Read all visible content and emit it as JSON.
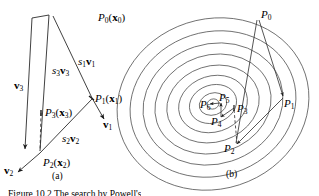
{
  "figure": {
    "panels": [
      {
        "id": "a",
        "label": "(a)",
        "description": "Vector construction diagram for conjugate direction search",
        "points": [
          {
            "name": "P0",
            "label_main": "P",
            "label_sub": "0",
            "label_arg": "(x",
            "label_arg_sub": "0",
            "label_arg_close": ")",
            "full": "P0(x0)",
            "x": 98,
            "y": 18
          },
          {
            "name": "P1",
            "label_main": "P",
            "label_sub": "1",
            "label_arg": "(x",
            "label_arg_sub": "1",
            "label_arg_close": ")",
            "full": "P1(x1)",
            "x": 94,
            "y": 99
          },
          {
            "name": "P2",
            "label_main": "P",
            "label_sub": "2",
            "label_arg": "(x",
            "label_arg_sub": "2",
            "label_arg_close": ")",
            "full": "P2(x2)",
            "x": 42,
            "y": 161
          },
          {
            "name": "P3",
            "label_main": "P",
            "label_sub": "3",
            "label_arg": "(x",
            "label_arg_sub": "3",
            "label_arg_close": ")",
            "full": "P3(x3)",
            "x": 45,
            "y": 113
          }
        ],
        "vectors": [
          {
            "name": "v1",
            "base": "v",
            "sub": "1",
            "full": "v1",
            "x": 102,
            "y": 123
          },
          {
            "name": "v2",
            "base": "v",
            "sub": "2",
            "full": "v2",
            "x": 4,
            "y": 168
          },
          {
            "name": "v3",
            "base": "v",
            "sub": "3",
            "full": "v3",
            "x": 15,
            "y": 85
          }
        ],
        "scaled_vectors": [
          {
            "name": "s1v1",
            "scalar": "s",
            "scalar_sub": "1",
            "vec": "v",
            "vec_sub": "1",
            "full": "s1v1",
            "x": 80,
            "y": 61
          },
          {
            "name": "s2v2",
            "scalar": "s",
            "scalar_sub": "2",
            "vec": "v",
            "vec_sub": "2",
            "full": "s2v2",
            "x": 63,
            "y": 138
          },
          {
            "name": "s3v3",
            "scalar": "s",
            "scalar_sub": "3",
            "vec": "v",
            "vec_sub": "3",
            "full": "s3v3",
            "x": 54,
            "y": 70
          }
        ]
      },
      {
        "id": "b",
        "label": "(b)",
        "description": "Concentric contour ellipses with iterate sequence",
        "points": [
          {
            "name": "P0",
            "label_main": "P",
            "label_sub": "0",
            "full": "P0",
            "x": 252,
            "y": 13
          },
          {
            "name": "P1",
            "label_main": "P",
            "label_sub": "1",
            "full": "P1",
            "x": 283,
            "y": 100
          },
          {
            "name": "P2",
            "label_main": "P",
            "label_sub": "2",
            "full": "P2",
            "x": 222,
            "y": 146
          },
          {
            "name": "P3",
            "label_main": "P",
            "label_sub": "3",
            "full": "P3",
            "x": 237,
            "y": 107
          },
          {
            "name": "P4",
            "label_main": "P",
            "label_sub": "4",
            "full": "P4",
            "x": 210,
            "y": 119
          },
          {
            "name": "P5",
            "label_main": "P",
            "label_sub": "5",
            "full": "P5",
            "x": 220,
            "y": 98
          },
          {
            "name": "P6",
            "label_main": "P",
            "label_sub": "6",
            "full": "P6",
            "x": 200,
            "y": 104
          }
        ]
      }
    ],
    "caption": {
      "text": "Figure 10.2   The search by Powell's",
      "visible_note": "clipped at image bottom edge"
    },
    "colors": {
      "stroke": "#2b2b2b",
      "contour": "#555555",
      "text": "#000000",
      "background": "#ffffff"
    }
  }
}
